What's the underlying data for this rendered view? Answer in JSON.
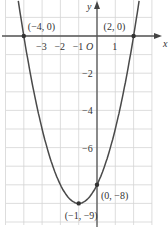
{
  "chart_data": {
    "type": "line",
    "title": "",
    "function": "y = x^2 + 2x - 8",
    "xlabel": "x",
    "ylabel": "y",
    "origin_label": "O",
    "x_ticks": [
      {
        "v": -3,
        "label": "−3"
      },
      {
        "v": -2,
        "label": "−2"
      },
      {
        "v": -1,
        "label": "−1"
      },
      {
        "v": 1,
        "label": "1"
      }
    ],
    "y_ticks": [
      {
        "v": -2,
        "label": "−2"
      },
      {
        "v": -4,
        "label": "−4"
      },
      {
        "v": -6,
        "label": "−6"
      }
    ],
    "xlim": [
      -5,
      3
    ],
    "ylim": [
      -10,
      2
    ],
    "grid": true,
    "points": [
      {
        "x": -4,
        "y": 0,
        "label": "(−4, 0)"
      },
      {
        "x": 2,
        "y": 0,
        "label": "(2, 0)"
      },
      {
        "x": 0,
        "y": -8,
        "label": "(0, −8)"
      },
      {
        "x": -1,
        "y": -9,
        "label": "(−1, −9)"
      }
    ],
    "curve_color": "#4a4a4a",
    "grid_color": "#d4d4d4"
  }
}
